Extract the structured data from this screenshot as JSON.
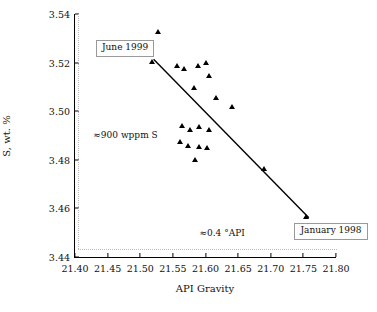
{
  "chart_data": {
    "type": "scatter",
    "title": "",
    "xlabel": "API Gravity",
    "ylabel": "S, wt. %",
    "xlim": [
      21.4,
      21.8
    ],
    "ylim": [
      3.44,
      3.54
    ],
    "xticks": [
      "21.40",
      "21.45",
      "21.50",
      "21.55",
      "21.60",
      "21.65",
      "21.70",
      "21.75",
      "21.80"
    ],
    "yticks": [
      "3.44",
      "3.46",
      "3.48",
      "3.50",
      "3.52",
      "3.54"
    ],
    "grid": false,
    "legend": "none",
    "points": [
      {
        "x": 21.527,
        "y": 3.5325
      },
      {
        "x": 21.517,
        "y": 3.5205
      },
      {
        "x": 21.556,
        "y": 3.5185
      },
      {
        "x": 21.566,
        "y": 3.5175
      },
      {
        "x": 21.588,
        "y": 3.5185
      },
      {
        "x": 21.6,
        "y": 3.52
      },
      {
        "x": 21.605,
        "y": 3.5145
      },
      {
        "x": 21.581,
        "y": 3.5095
      },
      {
        "x": 21.616,
        "y": 3.5055
      },
      {
        "x": 21.64,
        "y": 3.502
      },
      {
        "x": 21.563,
        "y": 3.494
      },
      {
        "x": 21.576,
        "y": 3.4925
      },
      {
        "x": 21.589,
        "y": 3.4935
      },
      {
        "x": 21.604,
        "y": 3.4925
      },
      {
        "x": 21.56,
        "y": 3.4875
      },
      {
        "x": 21.573,
        "y": 3.486
      },
      {
        "x": 21.59,
        "y": 3.4855
      },
      {
        "x": 21.602,
        "y": 3.485
      },
      {
        "x": 21.583,
        "y": 3.48
      },
      {
        "x": 21.688,
        "y": 3.4765
      },
      {
        "x": 21.752,
        "y": 3.457
      }
    ],
    "trendline": {
      "x1": 21.52,
      "y1": 3.5215,
      "x2": 21.757,
      "y2": 3.4565
    },
    "annotations": [
      {
        "text": "June 1999",
        "boxed": true,
        "x": 21.432,
        "y": 3.5265
      },
      {
        "text": "January 1998",
        "boxed": true,
        "x": 21.735,
        "y": 3.4515
      },
      {
        "text": "≈900 wppm S",
        "boxed": false,
        "x": 21.428,
        "y": 3.4895
      },
      {
        "text": "≈0.4 °API",
        "boxed": false,
        "x": 21.59,
        "y": 3.4495
      }
    ],
    "guides": [
      {
        "type": "dotted-vertical",
        "x": 21.404,
        "note": "left dotted rule inside frame"
      },
      {
        "type": "dotted-horizontal",
        "y": 3.4435,
        "note": "bottom dotted rule inside frame"
      }
    ]
  }
}
